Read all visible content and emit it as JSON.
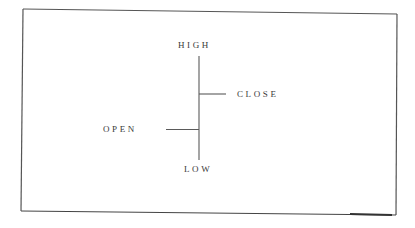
{
  "diagram": {
    "type": "ohlc-bar-legend",
    "labels": {
      "high": "HIGH",
      "close": "CLOSE",
      "open": "OPEN",
      "low": "LOW"
    },
    "colors": {
      "line": "#5a5a5a",
      "frame": "#4a4a4a",
      "text": "#3a3a3a",
      "background": "#ffffff"
    }
  }
}
